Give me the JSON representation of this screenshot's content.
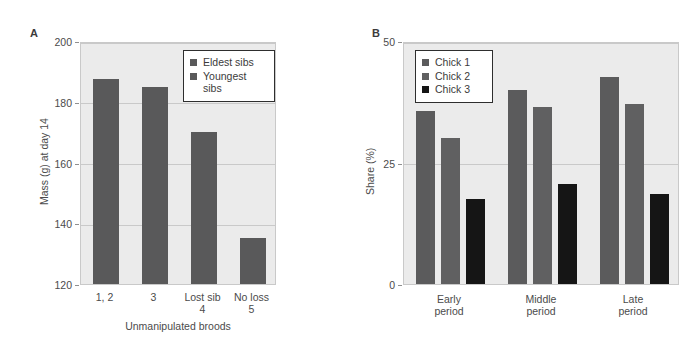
{
  "figure": {
    "background": "#ffffff",
    "plot_background": "#ebebeb",
    "grid_color": "#c9c9c9"
  },
  "panelA": {
    "letter": "A",
    "chart_data": {
      "type": "bar",
      "title": "",
      "xlabel": "Unmanipulated broods",
      "ylabel": "Mass (g) at day 14",
      "categories": [
        "1, 2",
        "3",
        "Lost sib",
        "No loss"
      ],
      "category_sublabels": [
        "",
        "",
        "4",
        "5"
      ],
      "values": [
        187.5,
        185.0,
        170.0,
        135.0
      ],
      "ylim": [
        120,
        200
      ],
      "yticks": [
        120,
        140,
        160,
        180,
        200
      ],
      "grid": true,
      "legend_position": "top-right",
      "series": [
        {
          "name": "Eldest sibs",
          "color": "#59595a"
        },
        {
          "name": "Youngest sibs",
          "color": "#59595a"
        }
      ],
      "bar_series_assignment": [
        "Eldest sibs",
        "Eldest sibs",
        "Eldest sibs",
        "Youngest sibs"
      ]
    },
    "legend": [
      {
        "label": "Eldest sibs",
        "color": "#59595a"
      },
      {
        "label": "Youngest\nsibs",
        "color": "#59595a"
      }
    ]
  },
  "panelB": {
    "letter": "B",
    "chart_data": {
      "type": "bar",
      "title": "",
      "xlabel": "",
      "ylabel": "Share (%)",
      "categories": [
        "Early\nperiod",
        "Middle\nperiod",
        "Late\nperiod"
      ],
      "ylim": [
        0,
        50
      ],
      "yticks": [
        0,
        25,
        50
      ],
      "ytick_labels": [
        "0",
        "25",
        "50"
      ],
      "grid": true,
      "legend_position": "top-left",
      "series": [
        {
          "name": "Chick 1",
          "color": "#5b5b5c",
          "values": [
            35.5,
            40.0,
            42.5
          ]
        },
        {
          "name": "Chick 2",
          "color": "#606061",
          "values": [
            30.0,
            36.5,
            37.0
          ]
        },
        {
          "name": "Chick 3",
          "color": "#151515",
          "values": [
            17.5,
            20.5,
            18.5
          ]
        }
      ]
    },
    "legend": [
      {
        "label": "Chick 1",
        "color": "#5b5b5c"
      },
      {
        "label": "Chick 2",
        "color": "#606061"
      },
      {
        "label": "Chick 3",
        "color": "#151515"
      }
    ]
  }
}
